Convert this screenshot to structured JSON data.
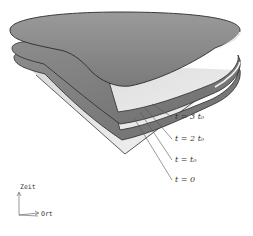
{
  "diagram": {
    "type": "3d-surface-stack",
    "surface_color": "#8a8a8a",
    "edge_color": "#2a2a2a",
    "time_labels": [
      {
        "text": "t = 3 t₀"
      },
      {
        "text": "t = 2 t₀"
      },
      {
        "text": "t = t₀"
      },
      {
        "text": "t = 0"
      }
    ],
    "axes": {
      "vertical_label": "Zeit",
      "horizontal_label": "Ort"
    }
  }
}
